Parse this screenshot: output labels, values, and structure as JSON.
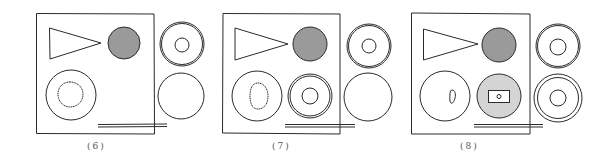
{
  "figure": {
    "colors": {
      "stroke": "#2a2a2a",
      "dark_fill": "#9a9a9a",
      "light_fill": "#d4d4d4",
      "background": "#ffffff"
    },
    "panels": [
      {
        "label": "(6)"
      },
      {
        "label": "(7)"
      },
      {
        "label": "(8)"
      }
    ]
  }
}
